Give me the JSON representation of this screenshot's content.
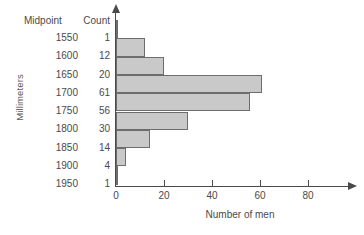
{
  "chart_data": {
    "type": "bar",
    "orientation": "horizontal",
    "title": "",
    "xlabel": "Number of men",
    "ylabel": "Millimeters",
    "categories": [
      "1550",
      "1600",
      "1650",
      "1700",
      "1750",
      "1800",
      "1850",
      "1900",
      "1950"
    ],
    "values": [
      1,
      12,
      20,
      61,
      56,
      30,
      14,
      4,
      1
    ],
    "xlim": [
      0,
      90
    ],
    "ylim": null,
    "xticks": [
      0,
      20,
      40,
      60,
      80
    ],
    "xticklabels": [
      "0",
      "20",
      "40",
      "60",
      "80"
    ],
    "grid": false,
    "legend": null,
    "bar_fill_color": "#c9c9c9",
    "bar_edge_color": "#6d6d6d",
    "axis_color": "#4a4a4a"
  },
  "table": {
    "headers": {
      "midpoint": "Midpoint",
      "count": "Count"
    },
    "rows": [
      {
        "midpoint": "1550",
        "count": "1"
      },
      {
        "midpoint": "1600",
        "count": "12"
      },
      {
        "midpoint": "1650",
        "count": "20"
      },
      {
        "midpoint": "1700",
        "count": "61"
      },
      {
        "midpoint": "1750",
        "count": "56"
      },
      {
        "midpoint": "1800",
        "count": "30"
      },
      {
        "midpoint": "1850",
        "count": "14"
      },
      {
        "midpoint": "1900",
        "count": "4"
      },
      {
        "midpoint": "1950",
        "count": "1"
      }
    ]
  },
  "axes": {
    "y_title": "Millimeters",
    "x_title": "Number of men",
    "x_tick_labels": [
      "0",
      "20",
      "40",
      "60",
      "80"
    ]
  }
}
